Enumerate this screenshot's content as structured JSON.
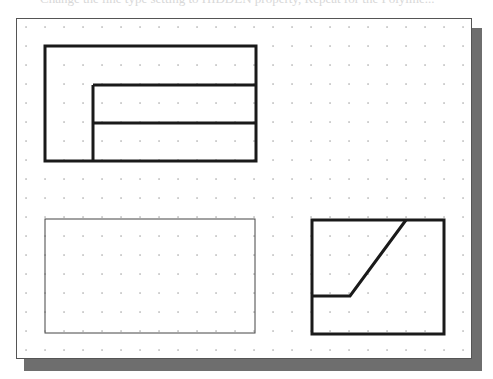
{
  "canvas": {
    "width": 493,
    "height": 379,
    "background": "#ffffff"
  },
  "bleed_text": "Change the line type setting to HIDDEN property, Repeat for the Polyline...",
  "viewport": {
    "frame": {
      "x": 16,
      "y": 18,
      "width": 456,
      "height": 341,
      "border_color": "#555555"
    },
    "shadow": {
      "x": 24,
      "y": 28,
      "width": 458,
      "height": 343,
      "color": "#6e6e6e"
    },
    "grid": {
      "origin_x": 26,
      "origin_y": 27,
      "spacing": 19,
      "cols": 24,
      "rows": 18,
      "dot_color": "#9a9a9a"
    }
  },
  "views": {
    "top_view": {
      "label": "top view",
      "outer": {
        "x": 45,
        "y": 46,
        "w": 211,
        "h": 115
      },
      "inner_lines": [
        {
          "x1": 93,
          "y1": 85,
          "x2": 256,
          "y2": 85
        },
        {
          "x1": 93,
          "y1": 123,
          "x2": 256,
          "y2": 123
        },
        {
          "x1": 93,
          "y1": 85,
          "x2": 93,
          "y2": 161
        }
      ],
      "stroke": "#1a1a1a",
      "stroke_width": 3
    },
    "front_view": {
      "label": "front view (thin outline)",
      "outer": {
        "x": 45,
        "y": 219,
        "w": 210,
        "h": 114
      },
      "stroke": "#444444",
      "stroke_width": 1
    },
    "side_view": {
      "label": "side view",
      "outer": {
        "x": 312,
        "y": 220,
        "w": 132,
        "h": 114
      },
      "polyline": "406,220 350,296 312,296",
      "stroke": "#1a1a1a",
      "stroke_width": 3
    }
  }
}
